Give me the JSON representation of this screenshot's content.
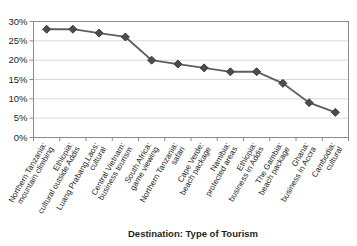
{
  "chart_data": {
    "type": "line",
    "title": "",
    "xlabel": "Destination: Type of Tourism",
    "ylabel": "",
    "ylim": [
      0,
      30
    ],
    "ytick_step": 5,
    "ytick_labels": [
      "0%",
      "5%",
      "10%",
      "15%",
      "20%",
      "25%",
      "30%"
    ],
    "grid": true,
    "legend_position": "none",
    "marker": "diamond",
    "categories": [
      "Northern Tanzania: mountain climbing",
      "Ethiopia: cultural outside Addis",
      "Luang Prabang,Laos: cultural",
      "Central Vietnam: business tourism",
      "South Africa: game viewing",
      "Northern Tanzania: safari",
      "Cape Verde: beach package",
      "Namibia: protected areas",
      "Ethiopia: business in Addis",
      "The Gambia: beach package",
      "Ghana: business in Accra",
      "Cambodia: cultural"
    ],
    "category_lines": [
      [
        "Northern Tanzania:",
        "mountain climbing"
      ],
      [
        "Ethiopia:",
        "cultural outside Addis"
      ],
      [
        "Luang Prabang,Laos:",
        "cultural"
      ],
      [
        "Central Vietnam:",
        "business tourism"
      ],
      [
        "South Africa:",
        "game viewing"
      ],
      [
        "Northern Tanzania:",
        "safari"
      ],
      [
        "Cape Verde:",
        "beach package"
      ],
      [
        "Namibia:",
        "protected areas"
      ],
      [
        "Ethiopia:",
        "business in Addis"
      ],
      [
        "The Gambia:",
        "beach package"
      ],
      [
        "Ghana:",
        "business in Accra"
      ],
      [
        "Cambodia:",
        "cultural"
      ]
    ],
    "values": [
      28,
      28,
      27,
      26,
      20,
      19,
      18,
      17,
      17,
      14,
      9,
      6.5
    ],
    "colors": {
      "line": "#5e5e5e",
      "marker_fill": "#4d4d4d",
      "marker_stroke": "#3b3b3b",
      "grid": "#d9d9d9",
      "axis": "#8c8c8c",
      "text": "#1f1f1f"
    }
  }
}
